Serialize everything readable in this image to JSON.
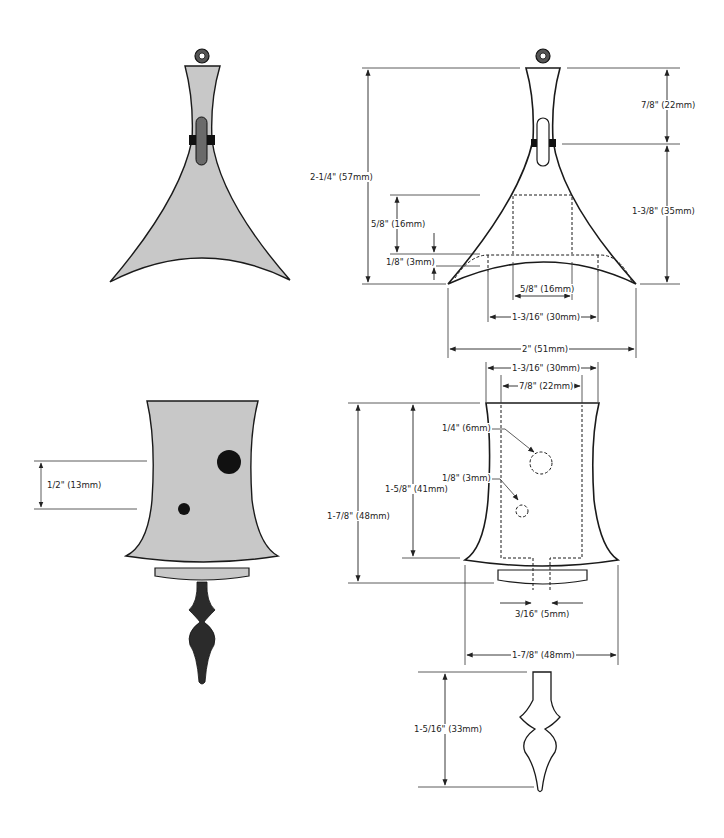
{
  "diagram": {
    "colors": {
      "fill": "#c8c8c8",
      "outline": "#1a1a1a",
      "dark": "#2b2b2b",
      "slot": "#6a6a6a",
      "dim_line": "#333333"
    },
    "views": {
      "top_shaded": {
        "name": "Top part (shaded view)"
      },
      "top_dimensioned": {
        "name": "Top part (dimensioned view)",
        "dimensions": {
          "overall_height": "2-1/4\" (57mm)",
          "neck_height": "7/8\" (22mm)",
          "body_height": "1-3/8\" (35mm)",
          "slot_depth": "5/8\" (16mm)",
          "arc_rise": "1/8\" (3mm)",
          "slot_width": "5/8\" (16mm)",
          "inner_width": "1-3/16\" (30mm)",
          "overall_width": "2\" (51mm)"
        }
      },
      "bottom_shaded": {
        "name": "Bottom part (shaded view)",
        "dimensions": {
          "hole_spacing": "1/2\" (13mm)"
        }
      },
      "bottom_dimensioned": {
        "name": "Bottom part (dimensioned view)",
        "dimensions": {
          "top_width": "1-3/16\" (30mm)",
          "bore_width": "7/8\" (22mm)",
          "large_hole": "1/4\" (6mm)",
          "small_hole": "1/8\" (3mm)",
          "bore_depth": "1-5/8\" (41mm)",
          "overall_height": "1-7/8\" (48mm)",
          "notch_width": "3/16\" (5mm)",
          "base_width": "1-7/8\" (48mm)"
        }
      },
      "finial": {
        "name": "Finial (dimensioned view)",
        "dimensions": {
          "height": "1-5/16\" (33mm)"
        }
      }
    }
  }
}
